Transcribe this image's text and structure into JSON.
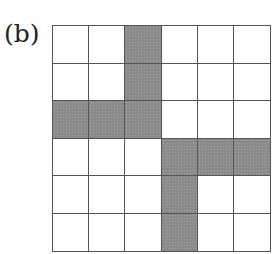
{
  "figure": {
    "label": "(b)",
    "rows": 6,
    "cols": 6,
    "shaded_color": "#8a8a8a",
    "shaded_cells": [
      [
        0,
        2
      ],
      [
        1,
        2
      ],
      [
        2,
        0
      ],
      [
        2,
        1
      ],
      [
        2,
        2
      ],
      [
        3,
        3
      ],
      [
        3,
        4
      ],
      [
        3,
        5
      ],
      [
        4,
        3
      ],
      [
        5,
        3
      ]
    ]
  }
}
